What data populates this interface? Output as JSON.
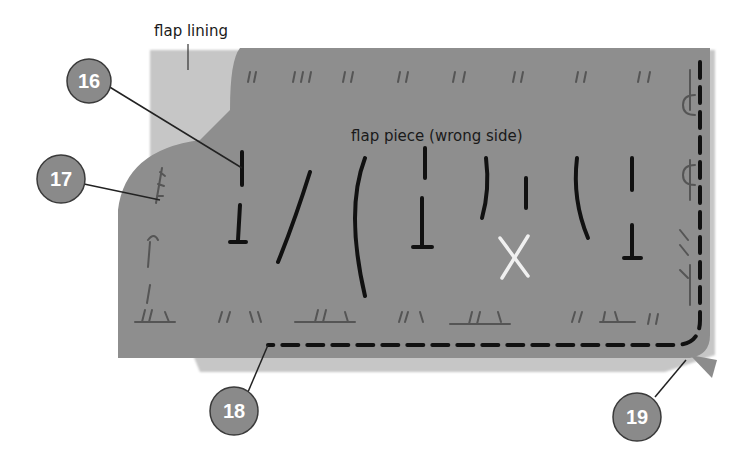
{
  "labels": {
    "flap_lining": "flap lining",
    "flap_piece": "flap piece (wrong side)"
  },
  "callouts": [
    {
      "number": "16",
      "target": "tailor-tack-stitch"
    },
    {
      "number": "17",
      "target": "side-edge-basting"
    },
    {
      "number": "18",
      "target": "bottom-stitching-line"
    },
    {
      "number": "19",
      "target": "corner-lining-tip"
    }
  ],
  "colors": {
    "flap_piece": "#8c8c8c",
    "flap_lining": "#c2c2c2",
    "stitch": "#111111",
    "mark_x": "#f2f2f2",
    "callout_fill": "#8a8a8a",
    "callout_stroke": "#3a3a3a"
  },
  "marks": {
    "center_mark": "X"
  }
}
